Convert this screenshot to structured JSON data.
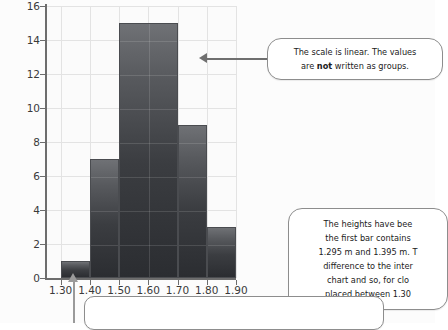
{
  "chart_data": {
    "type": "bar",
    "title": "",
    "subtitle": "",
    "xlabel": "Height (m)",
    "ylabel": "Frequency",
    "xlim": [
      1.25,
      1.9
    ],
    "ylim": [
      0,
      16
    ],
    "grid": true,
    "legend": "none",
    "bin_edges": [
      1.3,
      1.4,
      1.5,
      1.7,
      1.8,
      1.9
    ],
    "categories": [
      "1.30-1.40",
      "1.40-1.50",
      "1.50-1.70",
      "1.70-1.80",
      "1.80-1.90"
    ],
    "values": [
      1,
      7,
      15,
      9,
      3
    ],
    "bars": [
      {
        "label": "1.30-1.40",
        "start": 1.3,
        "end": 1.4,
        "frequency": 1
      },
      {
        "label": "1.40-1.50",
        "start": 1.4,
        "end": 1.5,
        "frequency": 7
      },
      {
        "label": "1.50-1.70",
        "start": 1.5,
        "end": 1.7,
        "frequency": 15
      },
      {
        "label": "1.70-1.80",
        "start": 1.7,
        "end": 1.8,
        "frequency": 9
      },
      {
        "label": "1.80-1.90",
        "start": 1.8,
        "end": 1.9,
        "frequency": 3
      }
    ],
    "y_ticks": [
      "0",
      "2",
      "4",
      "6",
      "8",
      "10",
      "12",
      "14",
      "16"
    ],
    "y_tick_values": [
      0,
      2,
      4,
      6,
      8,
      10,
      12,
      14,
      16
    ],
    "x_ticks": [
      "1.30",
      "1.40",
      "1.50",
      "1.60",
      "1.70",
      "1.80",
      "1.90"
    ],
    "x_tick_values": [
      1.3,
      1.4,
      1.5,
      1.6,
      1.7,
      1.8,
      1.9
    ],
    "bar_color": "#3b3d41",
    "grid_color": "#e3e3e3",
    "axis_color": "#6d6d6d"
  },
  "annotations": {
    "scale_callout": {
      "line1_a": "The scale is linear. The values",
      "line2_a": "are ",
      "line2_bold": "not",
      "line2_b": " written as groups."
    },
    "heights_callout": {
      "line1": "The heights have bee",
      "line2": "the first bar contains ",
      "line3": "1.295 m and 1.395 m. T",
      "line4": "difference to the inter",
      "line5": "chart and so, for clo",
      "line6": "placed between 1.30"
    },
    "bottom_callout": {
      "text": ""
    },
    "pointer_value": "1.345"
  }
}
